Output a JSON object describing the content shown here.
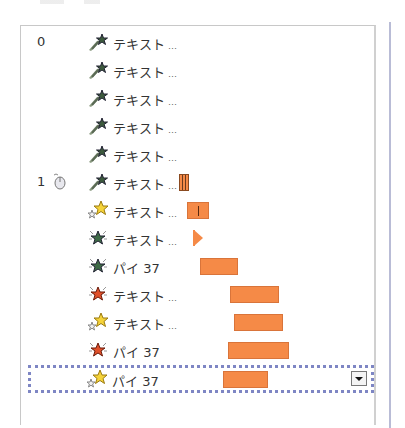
{
  "animation_pane": {
    "rows": [
      {
        "index_label": "0",
        "trigger": false,
        "effect": "emphasis-sparkle-green",
        "label": "テキスト",
        "ellipsis": "…",
        "bar": null
      },
      {
        "index_label": "",
        "trigger": false,
        "effect": "emphasis-sparkle-green",
        "label": "テキスト",
        "ellipsis": "…",
        "bar": null
      },
      {
        "index_label": "",
        "trigger": false,
        "effect": "emphasis-sparkle-green",
        "label": "テキスト",
        "ellipsis": "…",
        "bar": null
      },
      {
        "index_label": "",
        "trigger": false,
        "effect": "emphasis-sparkle-green",
        "label": "テキスト",
        "ellipsis": "…",
        "bar": null
      },
      {
        "index_label": "",
        "trigger": false,
        "effect": "emphasis-sparkle-green",
        "label": "テキスト",
        "ellipsis": "…",
        "bar": null
      },
      {
        "index_label": "1",
        "trigger": true,
        "effect": "emphasis-sparkle-green",
        "label": "テキスト",
        "ellipsis": "…",
        "bar": {
          "type": "stripes",
          "left": 178,
          "width": 10
        }
      },
      {
        "index_label": "",
        "trigger": false,
        "effect": "entrance-stars-yellow",
        "label": "テキスト",
        "ellipsis": "…",
        "bar": {
          "type": "marked",
          "left": 186,
          "width": 22
        }
      },
      {
        "index_label": "",
        "trigger": false,
        "effect": "emphasis-star-green",
        "label": "テキスト",
        "ellipsis": "…",
        "bar": {
          "type": "triangle",
          "left": 192,
          "width": 10
        }
      },
      {
        "index_label": "",
        "trigger": false,
        "effect": "emphasis-star-green",
        "label": "パイ 37",
        "ellipsis": "",
        "bar": {
          "type": "plain",
          "left": 199,
          "width": 38
        }
      },
      {
        "index_label": "",
        "trigger": false,
        "effect": "emphasis-star-red",
        "label": "テキスト",
        "ellipsis": "…",
        "bar": {
          "type": "plain",
          "left": 229,
          "width": 49
        }
      },
      {
        "index_label": "",
        "trigger": false,
        "effect": "entrance-stars-yellow",
        "label": "テキスト",
        "ellipsis": "…",
        "bar": {
          "type": "plain",
          "left": 233,
          "width": 49
        }
      },
      {
        "index_label": "",
        "trigger": false,
        "effect": "emphasis-star-red",
        "label": "パイ 37",
        "ellipsis": "",
        "bar": {
          "type": "plain",
          "left": 227,
          "width": 61
        }
      },
      {
        "index_label": "",
        "trigger": false,
        "effect": "entrance-stars-yellow",
        "label": "パイ 37",
        "ellipsis": "",
        "bar": {
          "type": "plain",
          "left": 223,
          "width": 45
        },
        "selected": true
      }
    ],
    "trigger_icon": "mouse-click-icon",
    "dropdown_icon": "chevron-down-icon"
  },
  "colors": {
    "bar_fill": "#f58a47",
    "selection_border": "#7e86c4",
    "frame_rule": "#b9bcd6"
  }
}
